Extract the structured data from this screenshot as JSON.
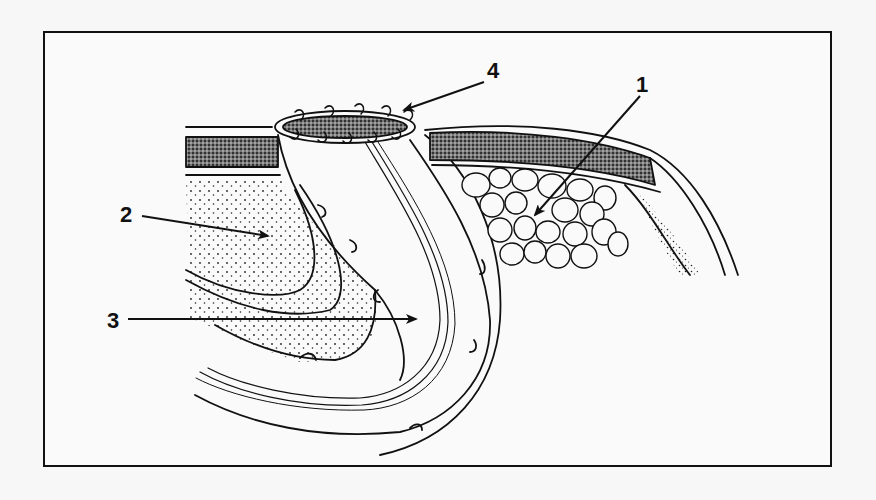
{
  "figure": {
    "type": "anatomical line illustration",
    "background": "#f7f7f7",
    "ink_color": "#111111",
    "frame": {
      "x": 44,
      "y": 32,
      "width": 787,
      "height": 434
    }
  },
  "labels": [
    {
      "id": "1",
      "text": "1",
      "x": 642,
      "y": 92,
      "arrow_from": [
        640,
        96
      ],
      "arrow_to": [
        535,
        215
      ],
      "target": "fatty tissue (adipose cells)"
    },
    {
      "id": "2",
      "text": "2",
      "x": 120,
      "y": 222,
      "arrow_from": [
        140,
        215
      ],
      "arrow_to": [
        268,
        236
      ],
      "target": "stippled tissue layer (left)"
    },
    {
      "id": "3",
      "text": "3",
      "x": 108,
      "y": 330,
      "arrow_from": [
        128,
        319
      ],
      "arrow_to": [
        416,
        319
      ],
      "target": "bowel lumen / intestinal wall"
    },
    {
      "id": "4",
      "text": "4",
      "x": 490,
      "y": 77,
      "arrow_from": [
        485,
        80
      ],
      "arrow_to": [
        403,
        110
      ],
      "target": "everted sutured stoma edge"
    }
  ]
}
